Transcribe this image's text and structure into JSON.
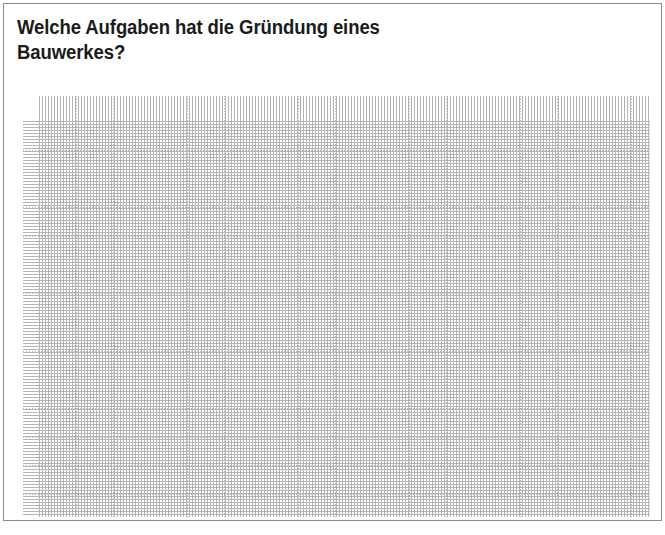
{
  "worksheet": {
    "question_title": "Welche Aufgaben hat die Gründung eines\nBauwerkes?",
    "question_line_1": "Welche Aufgaben hat die Gründung eines",
    "question_line_2": "Bauwerkes?",
    "answer_area_placeholder": "",
    "colors": {
      "page_background": "#ffffff",
      "frame_border": "#59595b",
      "text": "#1b1b1b",
      "grid_dot": "#b4b4b6"
    },
    "grid": {
      "column_count": 17,
      "row_count": 15,
      "column_spacing_px": 37,
      "row_spacing_px": 28.7,
      "style": "dotted"
    }
  }
}
